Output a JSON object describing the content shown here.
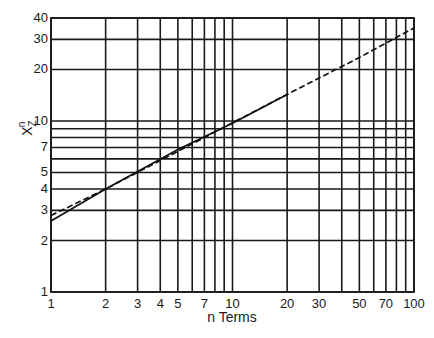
{
  "chart_data": {
    "type": "line",
    "title": "",
    "xlabel": "n Terms",
    "ylabel": "X_Z^n",
    "xscale": "log",
    "yscale": "log",
    "xlim": [
      1,
      100
    ],
    "ylim": [
      1,
      40
    ],
    "grid": true,
    "legend": null,
    "x_tick_labels": [
      "1",
      "2",
      "3",
      "4",
      "5",
      "7",
      "10",
      "20",
      "30",
      "50",
      "70",
      "100"
    ],
    "x_gridlines": [
      1,
      2,
      3,
      4,
      5,
      6,
      7,
      8,
      9,
      10,
      20,
      30,
      40,
      50,
      60,
      70,
      80,
      90,
      100
    ],
    "y_tick_labels": [
      "1",
      "2",
      "3",
      "4",
      "5",
      "7",
      "10",
      "20",
      "30",
      "40"
    ],
    "y_gridlines": [
      1,
      2,
      3,
      4,
      5,
      6,
      7,
      8,
      9,
      10,
      20,
      30,
      40
    ],
    "series": [
      {
        "name": "solid",
        "style": "solid",
        "x": [
          1,
          2,
          5,
          10,
          20
        ],
        "y": [
          2.6,
          4.0,
          6.8,
          9.7,
          14.3
        ]
      },
      {
        "name": "dashed",
        "style": "dashed",
        "x": [
          1,
          2,
          20,
          50,
          100
        ],
        "y": [
          2.8,
          4.0,
          14.3,
          23.5,
          35
        ]
      }
    ]
  },
  "layout": {
    "plot_left": 51,
    "plot_right": 414,
    "plot_top": 18,
    "plot_bottom": 292,
    "y_max": 40
  }
}
